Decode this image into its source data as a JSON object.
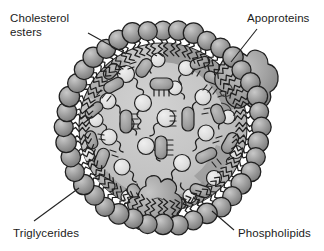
{
  "diagram": {
    "type": "lipoprotein-particle-cross-section",
    "labels": [
      {
        "id": "cholesterol-esters",
        "text": "Cholesterol\nesters",
        "line_from": [
          88,
          33
        ],
        "line_to": [
          125,
          53
        ]
      },
      {
        "id": "apoproteins",
        "text": "Apoproteins",
        "line_from": [
          258,
          28
        ],
        "line_to": [
          232,
          62
        ]
      },
      {
        "id": "triglycerides",
        "text": "Triglycerides",
        "line_from": [
          33,
          222
        ],
        "line_to": [
          78,
          188
        ]
      },
      {
        "id": "phospholipids",
        "text": "Phospholipids",
        "line_from": [
          233,
          230
        ],
        "line_to": [
          213,
          212
        ]
      }
    ],
    "colors": {
      "background": "#ffffff",
      "outline": "#1c1c1c",
      "shell_sphere": "#8e8e8e",
      "shell_sphere_highlight": "#c4c4c4",
      "shell_band": "#7f7f7f",
      "core_fill": "#c0c0c0",
      "core_fill_light": "#cdcdcd",
      "apoprotein": "#9a9a9a",
      "apoprotein_highlight": "#bdbdbd",
      "particle_light": "#dcdcdc",
      "particle_dark": "#a6a6a6",
      "label_text": "#1b1b1b",
      "leader_line": "#2a2a2a"
    },
    "geometry": {
      "center": [
        163,
        127
      ],
      "core_radius": 83,
      "shell_radius": 98,
      "shell_sphere_radius": 9.5,
      "shell_sphere_count": 40
    },
    "components": {
      "shell": "phospholipid monolayer of spherical polar heads with two zigzag hydrophobic tails directed inward",
      "core_circles": "cholesterol ester molecules drawn as pale circles with a curled squiggly tail",
      "core_capsules": "triglyceride molecules drawn as dark rounded capsules with comb-like bristle tails",
      "apoproteins": "two large irregular blobs embedded in the shell, upper-right and bottom-center"
    }
  }
}
